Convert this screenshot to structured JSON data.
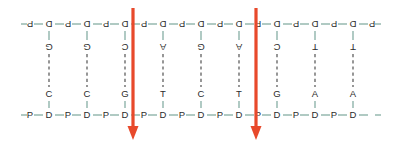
{
  "diagram": {
    "type": "dna-duplex-cut-diagram",
    "colors": {
      "backbone_bond": "#6f9e93",
      "letter": "#2b2b2b",
      "hydrogen_bond": "#3a3a3a",
      "arrow": "#e8492b",
      "background": "#ffffff"
    },
    "backbone": {
      "sugar_label": "D",
      "phosphate_label": "P",
      "top_strand_rotated": true,
      "top_rotation_degrees": 180
    },
    "base_pairs": [
      {
        "index": 1,
        "top_base": "G",
        "bottom_base": "C",
        "hbonds": 3
      },
      {
        "index": 2,
        "top_base": "G",
        "bottom_base": "C",
        "hbonds": 3
      },
      {
        "index": 3,
        "top_base": "C",
        "bottom_base": "G",
        "hbonds": 3
      },
      {
        "index": 4,
        "top_base": "A",
        "bottom_base": "T",
        "hbonds": 2
      },
      {
        "index": 5,
        "top_base": "G",
        "bottom_base": "C",
        "hbonds": 3
      },
      {
        "index": 6,
        "top_base": "A",
        "bottom_base": "T",
        "hbonds": 2
      },
      {
        "index": 7,
        "top_base": "C",
        "bottom_base": "G",
        "hbonds": 3
      },
      {
        "index": 8,
        "top_base": "T",
        "bottom_base": "A",
        "hbonds": 2
      },
      {
        "index": 9,
        "top_base": "T",
        "bottom_base": "A",
        "hbonds": 2
      }
    ],
    "top_strand_sequence": "G G C A G A C T T",
    "bottom_strand_sequence": "C C G T C T G A A",
    "arrows": [
      {
        "id": "cut-site-1",
        "direction": "down",
        "x": 133,
        "after_base_pair": 3
      },
      {
        "id": "cut-site-2",
        "direction": "down",
        "x": 256,
        "after_base_pair": 6
      }
    ]
  }
}
